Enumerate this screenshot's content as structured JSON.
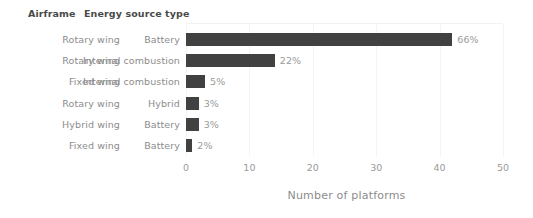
{
  "headers": {
    "airframe": "Airframe",
    "energy_source_type": "Energy source type"
  },
  "rows": [
    {
      "airframe": "Rotary wing",
      "energy": "Battery",
      "value": 42,
      "percent": "66%"
    },
    {
      "airframe": "Rotary wing",
      "energy": "Internal combustion",
      "value": 14,
      "percent": "22%"
    },
    {
      "airframe": "Fixed wing",
      "energy": "Internal combustion",
      "value": 3,
      "percent": "5%"
    },
    {
      "airframe": "Rotary wing",
      "energy": "Hybrid",
      "value": 2,
      "percent": "3%"
    },
    {
      "airframe": "Hybrid wing",
      "energy": "Battery",
      "value": 2,
      "percent": "3%"
    },
    {
      "airframe": "Fixed wing",
      "energy": "Battery",
      "value": 1,
      "percent": "2%"
    }
  ],
  "axis": {
    "title": "Number of platforms",
    "ticks": [
      "0",
      "10",
      "20",
      "30",
      "40",
      "50"
    ]
  },
  "colors": {
    "bar": "#414141",
    "label": "#8c8c8c",
    "value_label": "#9a9a9a",
    "header": "#4a4a4a",
    "gridline": "#f4f4f4",
    "background": "#ffffff"
  },
  "chart_data": {
    "type": "bar",
    "orientation": "horizontal",
    "title": "",
    "xlabel": "Number of platforms",
    "ylabel": "",
    "xlim": [
      0,
      50
    ],
    "xticks": [
      0,
      10,
      20,
      30,
      40,
      50
    ],
    "grid": true,
    "legend": "none",
    "categories": [
      "Rotary wing / Battery",
      "Rotary wing / Internal combustion",
      "Fixed wing / Internal combustion",
      "Rotary wing / Hybrid",
      "Hybrid wing / Battery",
      "Fixed wing / Battery"
    ],
    "values": [
      42,
      14,
      3,
      2,
      2,
      1
    ],
    "data_labels": [
      "66%",
      "22%",
      "5%",
      "3%",
      "3%",
      "2%"
    ],
    "group_columns": [
      "Airframe",
      "Energy source type"
    ],
    "groups": [
      [
        "Rotary wing",
        "Battery"
      ],
      [
        "Rotary wing",
        "Internal combustion"
      ],
      [
        "Fixed wing",
        "Internal combustion"
      ],
      [
        "Rotary wing",
        "Hybrid"
      ],
      [
        "Hybrid wing",
        "Battery"
      ],
      [
        "Fixed wing",
        "Battery"
      ]
    ]
  }
}
